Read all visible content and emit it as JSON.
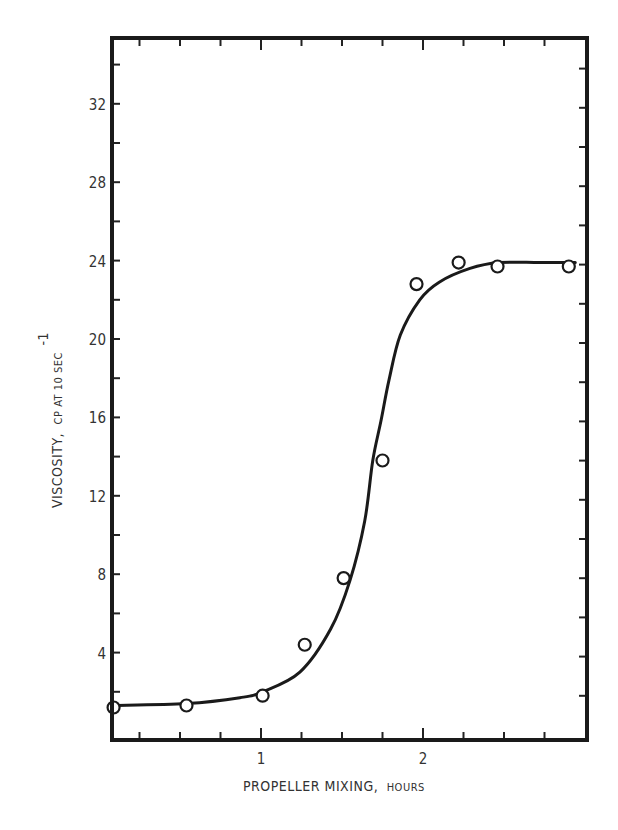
{
  "chart_data": {
    "type": "scatter",
    "title": "",
    "xlabel": "PROPELLER MIXING, HOURS",
    "xlabel_main": "PROPELLER MIXING,",
    "xlabel_units": "HOURS",
    "ylabel": "VISCOSITY, CP AT 10 SEC^-1",
    "ylabel_main": "VISCOSITY,",
    "ylabel_units": "CP AT 10 SEC",
    "ylabel_superscript": "-1",
    "xlim": [
      0.08,
      3.0
    ],
    "ylim": [
      -0.4,
      35.2
    ],
    "x_ticks": [
      1,
      2
    ],
    "x_tick_labels": [
      "1",
      "2"
    ],
    "x_minor_step": 0.25,
    "y_ticks": [
      4,
      8,
      12,
      16,
      20,
      24,
      28,
      32
    ],
    "y_tick_labels": [
      "4",
      "8",
      "12",
      "16",
      "20",
      "24",
      "28",
      "32"
    ],
    "y_minor_step": 2,
    "grid": false,
    "legend": null,
    "series": [
      {
        "name": "Measured viscosity",
        "marker": "open-circle",
        "x": [
          0.09,
          0.54,
          1.01,
          1.27,
          1.51,
          1.75,
          1.96,
          2.22,
          2.46,
          2.9
        ],
        "y": [
          1.2,
          1.3,
          1.8,
          4.4,
          7.8,
          13.8,
          22.8,
          23.9,
          23.7,
          23.7
        ]
      },
      {
        "name": "Fitted sigmoid curve",
        "marker": "none",
        "line": "solid",
        "x": [
          0.08,
          0.54,
          0.87,
          1.01,
          1.24,
          1.43,
          1.55,
          1.64,
          1.69,
          1.74,
          1.79,
          1.86,
          1.98,
          2.1,
          2.29,
          2.47,
          2.72,
          2.94
        ],
        "y": [
          1.3,
          1.4,
          1.7,
          2.0,
          3.0,
          5.2,
          7.7,
          10.7,
          13.8,
          15.8,
          17.9,
          20.2,
          22.0,
          22.9,
          23.6,
          23.9,
          23.9,
          23.9
        ]
      }
    ]
  }
}
